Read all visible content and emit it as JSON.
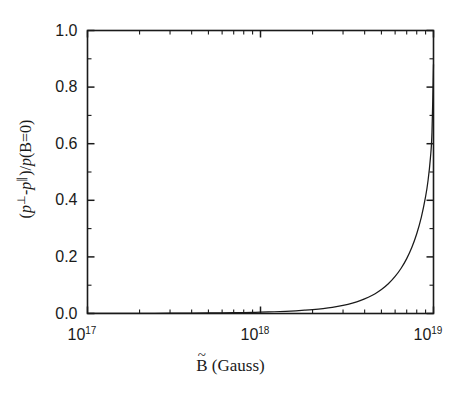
{
  "chart_data": {
    "type": "line",
    "title": "",
    "subtitle": "",
    "xlabel": "B̃ (Gauss)",
    "xlabel_parts": {
      "symbol": "B",
      "accent": "~",
      "unit": "(Gauss)"
    },
    "ylabel": "(p⊥-p∥)/p(B=0)",
    "ylabel_parts": {
      "open": "(",
      "p1": "p",
      "sup1": "⊥",
      "minus": "-",
      "p2": "p",
      "sup2": "∥",
      "close_div": ")/",
      "p3": "p",
      "tail": "(B=0)"
    },
    "xscale": "log",
    "yscale": "linear",
    "xlim": [
      1e+17,
      1e+19
    ],
    "ylim": [
      0.0,
      1.0
    ],
    "grid": false,
    "legend": false,
    "legend_position": "none",
    "x_tick_labels": [
      "10^17",
      "10^18",
      "10^19"
    ],
    "x_tick_mantissas": [
      "10",
      "10",
      "10"
    ],
    "x_tick_exponents": [
      "17",
      "18",
      "19"
    ],
    "x_tick_values": [
      1e+17,
      1e+18,
      1e+19
    ],
    "x_minor_decade_multipliers": [
      2,
      3,
      4,
      5,
      6,
      7,
      8,
      9
    ],
    "y_tick_labels": [
      "0.0",
      "0.2",
      "0.4",
      "0.6",
      "0.8",
      "1.0"
    ],
    "y_tick_values": [
      0.0,
      0.2,
      0.4,
      0.6,
      0.8,
      1.0
    ],
    "y_minor_tick_values": [
      0.1,
      0.3,
      0.5,
      0.7,
      0.9
    ],
    "series": [
      {
        "name": "anisotropy",
        "color": "#1a1a1a",
        "linewidth": 1.25,
        "x": [
          1e+17,
          1.5e+17,
          2e+17,
          3e+17,
          4e+17,
          5e+17,
          6e+17,
          7e+17,
          8e+17,
          9e+17,
          1e+18,
          1.2e+18,
          1.4e+18,
          1.6e+18,
          1.8e+18,
          2e+18,
          2.3e+18,
          2.6e+18,
          3e+18,
          3.4e+18,
          3.8e+18,
          4.2e+18,
          4.6e+18,
          5e+18,
          5.5e+18,
          6e+18,
          6.5e+18,
          7e+18,
          7.5e+18,
          8e+18,
          8.5e+18,
          9e+18,
          9.3e+18,
          9.6e+18,
          9.8e+18,
          1e+19
        ],
        "y": [
          0.0002,
          0.0004,
          0.0006,
          0.001,
          0.0014,
          0.0019,
          0.0024,
          0.0029,
          0.0035,
          0.0041,
          0.0048,
          0.0062,
          0.0078,
          0.0096,
          0.0116,
          0.0138,
          0.0176,
          0.022,
          0.029,
          0.037,
          0.0465,
          0.0575,
          0.07,
          0.0845,
          0.106,
          0.131,
          0.16,
          0.194,
          0.234,
          0.282,
          0.34,
          0.413,
          0.47,
          0.55,
          0.64,
          0.88
        ]
      }
    ],
    "annotations": [],
    "endpoint_value": 0.88,
    "axis_color": "#1a1a1a",
    "background": "#ffffff"
  }
}
